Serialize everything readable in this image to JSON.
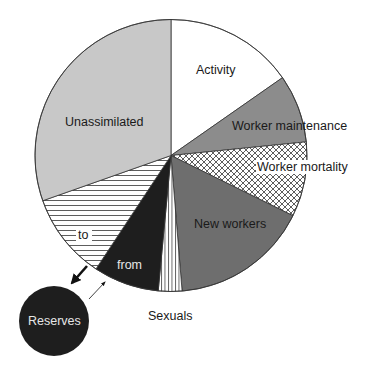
{
  "chart_data": {
    "type": "pie",
    "title": "",
    "start_angle_deg": 0,
    "direction": "clockwise",
    "units": "percent of energy budget (estimated from slice angles)",
    "slices": [
      {
        "label": "Activity",
        "value": 15.3,
        "fill": "#ffffff",
        "pattern": "none",
        "text_color": "#1a1a1a"
      },
      {
        "label": "Worker maintenance",
        "value": 8.1,
        "fill": "#8c8c8c",
        "pattern": "none",
        "text_color": "#1a1a1a"
      },
      {
        "label": "Worker mortality",
        "value": 8.9,
        "fill": "#ffffff",
        "pattern": "crosshatch",
        "text_color": "#1a1a1a"
      },
      {
        "label": "New workers",
        "value": 16.4,
        "fill": "#6e6e6e",
        "pattern": "none",
        "text_color": "#1a1a1a"
      },
      {
        "label": "Sexuals",
        "value": 2.8,
        "fill": "#ffffff",
        "pattern": "vertical-lines",
        "text_color": "#1a1a1a"
      },
      {
        "label": "from",
        "value": 7.8,
        "fill": "#1e1e1e",
        "pattern": "none",
        "text_color": "#e6e6e6"
      },
      {
        "label": "to",
        "value": 10.3,
        "fill": "#ffffff",
        "pattern": "horizontal-lines",
        "text_color": "#1a1a1a"
      },
      {
        "label": "Unassimilated",
        "value": 30.4,
        "fill": "#c8c8c8",
        "pattern": "none",
        "text_color": "#1a1a1a"
      }
    ],
    "external_node": {
      "label": "Reserves",
      "fill": "#1e1e1e",
      "text_color": "#e6e6e6"
    },
    "arrows": [
      {
        "from": "to",
        "to": "Reserves",
        "style": "thick"
      },
      {
        "from": "Reserves",
        "to": "from",
        "style": "thin"
      }
    ],
    "legend": "none"
  },
  "labels": {
    "activity": "Activity",
    "worker_maintenance": "Worker maintenance",
    "worker_mortality": "Worker mortality",
    "new_workers": "New workers",
    "sexuals": "Sexuals",
    "from": "from",
    "to": "to",
    "unassimilated": "Unassimilated",
    "reserves": "Reserves"
  }
}
